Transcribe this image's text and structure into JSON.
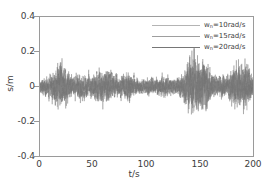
{
  "chart_data": {
    "type": "line",
    "title": "",
    "xlabel": "t/s",
    "ylabel": "s/m",
    "xlim": [
      0,
      200
    ],
    "ylim": [
      -0.4,
      0.4
    ],
    "xticks": [
      0,
      50,
      100,
      150,
      200
    ],
    "xtick_labels": [
      "0",
      "50",
      "100",
      "150",
      "200"
    ],
    "yticks": [
      0.4,
      0.2,
      0,
      -0.2,
      -0.4
    ],
    "ytick_labels": [
      "0.4",
      "0.2",
      "0",
      "-0.2",
      "-0.4"
    ],
    "grid": false,
    "legend_position": "upper right",
    "series": [
      {
        "name": "w_n=10rad/s",
        "symbol_base": "w",
        "symbol_sub": "n",
        "value_text": "=10rad/s",
        "color": "#b4b4b4",
        "seed": 11,
        "base_amplitude": 0.03,
        "burst_gain": 0.85,
        "frequency": 10,
        "noise_max": 0.21,
        "noise_min": -0.24
      },
      {
        "name": "w_n=15rad/s",
        "symbol_base": "w",
        "symbol_sub": "n",
        "value_text": "=15rad/s",
        "color": "#9e9e9e",
        "seed": 37,
        "base_amplitude": 0.034,
        "burst_gain": 1.0,
        "frequency": 15,
        "noise_max": 0.19,
        "noise_min": -0.29
      },
      {
        "name": "w_n=20rad/s",
        "symbol_base": "w",
        "symbol_sub": "n",
        "value_text": "=20rad/s",
        "color": "#767676",
        "seed": 71,
        "base_amplitude": 0.038,
        "burst_gain": 1.15,
        "frequency": 20,
        "noise_max": 0.22,
        "noise_min": -0.35
      }
    ],
    "envelope": [
      {
        "t": 0,
        "a": 0.55
      },
      {
        "t": 5,
        "a": 0.8
      },
      {
        "t": 10,
        "a": 0.95
      },
      {
        "t": 15,
        "a": 1.55
      },
      {
        "t": 20,
        "a": 2.1
      },
      {
        "t": 23,
        "a": 1.7
      },
      {
        "t": 28,
        "a": 1.0
      },
      {
        "t": 33,
        "a": 0.85
      },
      {
        "t": 38,
        "a": 1.05
      },
      {
        "t": 44,
        "a": 0.9
      },
      {
        "t": 50,
        "a": 0.95
      },
      {
        "t": 56,
        "a": 1.45
      },
      {
        "t": 60,
        "a": 1.25
      },
      {
        "t": 64,
        "a": 1.6
      },
      {
        "t": 68,
        "a": 1.05
      },
      {
        "t": 73,
        "a": 0.8
      },
      {
        "t": 78,
        "a": 0.95
      },
      {
        "t": 83,
        "a": 1.3
      },
      {
        "t": 88,
        "a": 0.8
      },
      {
        "t": 93,
        "a": 0.7
      },
      {
        "t": 98,
        "a": 0.6
      },
      {
        "t": 103,
        "a": 0.75
      },
      {
        "t": 108,
        "a": 0.62
      },
      {
        "t": 113,
        "a": 0.8
      },
      {
        "t": 118,
        "a": 0.95
      },
      {
        "t": 122,
        "a": 0.7
      },
      {
        "t": 127,
        "a": 0.65
      },
      {
        "t": 132,
        "a": 0.85
      },
      {
        "t": 136,
        "a": 1.4
      },
      {
        "t": 140,
        "a": 2.2
      },
      {
        "t": 145,
        "a": 2.6
      },
      {
        "t": 149,
        "a": 2.2
      },
      {
        "t": 153,
        "a": 2.35
      },
      {
        "t": 157,
        "a": 1.9
      },
      {
        "t": 161,
        "a": 1.15
      },
      {
        "t": 166,
        "a": 0.8
      },
      {
        "t": 171,
        "a": 0.95
      },
      {
        "t": 176,
        "a": 0.85
      },
      {
        "t": 181,
        "a": 1.7
      },
      {
        "t": 185,
        "a": 2.0
      },
      {
        "t": 189,
        "a": 1.75
      },
      {
        "t": 193,
        "a": 1.95
      },
      {
        "t": 197,
        "a": 1.4
      },
      {
        "t": 200,
        "a": 0.9
      }
    ]
  },
  "legend": {
    "items": [
      {
        "label": "w",
        "sub": "n",
        "rest": "=10rad/s"
      },
      {
        "label": "w",
        "sub": "n",
        "rest": "=15rad/s"
      },
      {
        "label": "w",
        "sub": "n",
        "rest": "=20rad/s"
      }
    ]
  },
  "axes": {
    "x_label": "t/s",
    "y_label": "s/m"
  }
}
